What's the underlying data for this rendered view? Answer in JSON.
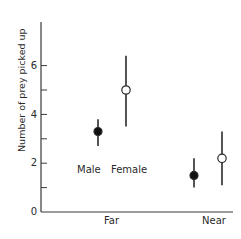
{
  "chart_data": {
    "type": "scatter",
    "title": "",
    "xlabel": "",
    "ylabel": "Number of prey picked up",
    "categories": [
      "Far",
      "Near"
    ],
    "ylim": [
      0,
      7.5
    ],
    "yticks_labeled": [
      0,
      2,
      4,
      6
    ],
    "yticks_minor": [
      1,
      3,
      5
    ],
    "grid": false,
    "legend": "inline labels under Far group",
    "series": [
      {
        "name": "Male",
        "marker": "filled-circle",
        "values": [
          3.3,
          1.5
        ],
        "error_low": [
          2.7,
          1.0
        ],
        "error_high": [
          3.8,
          2.2
        ]
      },
      {
        "name": "Female",
        "marker": "open-circle",
        "values": [
          5.0,
          2.2
        ],
        "error_low": [
          3.5,
          1.1
        ],
        "error_high": [
          6.4,
          3.3
        ]
      }
    ],
    "annotations": [
      {
        "text": "Male",
        "near": "Far group, below male point"
      },
      {
        "text": "Female",
        "near": "Far group, below female point"
      }
    ]
  },
  "labels": {
    "ylabel": "Number of prey picked up",
    "x_far": "Far",
    "x_near": "Near",
    "male": "Male",
    "female": "Female",
    "tick_0": "0",
    "tick_2": "2",
    "tick_4": "4",
    "tick_6": "6"
  },
  "colors": {
    "ink": "#2a2a2a",
    "background": "#ffffff"
  }
}
